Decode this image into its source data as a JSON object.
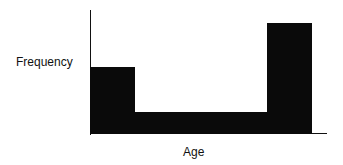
{
  "chart_data": {
    "type": "bar",
    "title": "",
    "xlabel": "Age",
    "ylabel": "Frequency",
    "categories": [
      "Young",
      "Middle",
      "Old"
    ],
    "values": [
      6,
      2,
      10
    ],
    "ylim": [
      0,
      11
    ],
    "grid": false,
    "legend": null
  },
  "labels": {
    "x": "Age",
    "y": "Frequency"
  }
}
